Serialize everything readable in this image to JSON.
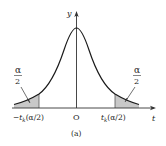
{
  "figure": {
    "caption": "(a)",
    "colors": {
      "curve": "#1a1a1a",
      "shade": "#c8c8c8",
      "axis": "#333333"
    }
  },
  "axes": {
    "x_label": "t",
    "y_label": "y",
    "origin_label": "O"
  },
  "ticks": {
    "left": "−t",
    "left_sub": "k",
    "left_arg": "(α/2)",
    "right": "t",
    "right_sub": "k",
    "right_arg": "(α/2)"
  },
  "annotations": {
    "left_tail": {
      "numerator": "α",
      "denominator": "2"
    },
    "right_tail": {
      "numerator": "α",
      "denominator": "2"
    }
  }
}
